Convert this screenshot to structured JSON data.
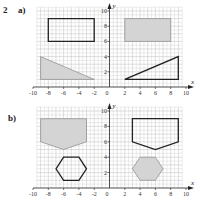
{
  "question_number": "2",
  "colors": {
    "grid": "#c8c8c8",
    "axis": "#222222",
    "shade": "#d4d4d4",
    "outline": "#222222"
  },
  "chart_data": [
    {
      "type": "diagram",
      "part": "a)",
      "xlabel": "x",
      "ylabel": "y",
      "xlim": [
        -10,
        10
      ],
      "ylim": [
        0,
        10
      ],
      "grid": true,
      "x_ticks": [
        "-10",
        "-8",
        "-6",
        "-4",
        "-2",
        "2",
        "4",
        "6",
        "8",
        "10"
      ],
      "x_tick_values": [
        -10,
        -8,
        -6,
        -4,
        -2,
        2,
        4,
        6,
        8,
        10
      ],
      "y_ticks": [
        "2",
        "4",
        "6",
        "8",
        "10"
      ],
      "y_tick_values": [
        2,
        4,
        6,
        8,
        10
      ],
      "origin_label": "0",
      "shapes": [
        {
          "name": "rectangle-left",
          "filled": false,
          "points": [
            [
              -8,
              6
            ],
            [
              -2,
              6
            ],
            [
              -2,
              9
            ],
            [
              -8,
              9
            ]
          ]
        },
        {
          "name": "rectangle-right",
          "filled": true,
          "points": [
            [
              2,
              6
            ],
            [
              8,
              6
            ],
            [
              8,
              9
            ],
            [
              2,
              9
            ]
          ]
        },
        {
          "name": "triangle-left",
          "filled": true,
          "points": [
            [
              -9,
              1
            ],
            [
              -9,
              4
            ],
            [
              -2,
              1
            ]
          ]
        },
        {
          "name": "triangle-right",
          "filled": false,
          "points": [
            [
              2,
              1
            ],
            [
              9,
              1
            ],
            [
              9,
              4
            ]
          ]
        }
      ]
    },
    {
      "type": "diagram",
      "part": "b)",
      "xlabel": "x",
      "ylabel": "y",
      "xlim": [
        -10,
        10
      ],
      "ylim": [
        0,
        10
      ],
      "grid": true,
      "x_ticks": [
        "-10",
        "-8",
        "-6",
        "-4",
        "-2",
        "2",
        "4",
        "6",
        "8",
        "10"
      ],
      "x_tick_values": [
        -10,
        -8,
        -6,
        -4,
        -2,
        2,
        4,
        6,
        8,
        10
      ],
      "y_ticks": [
        "2",
        "4",
        "6",
        "8",
        "10"
      ],
      "y_tick_values": [
        2,
        4,
        6,
        8,
        10
      ],
      "origin_label": "0",
      "shapes": [
        {
          "name": "pentagon-left",
          "filled": true,
          "points": [
            [
              -9,
              9
            ],
            [
              -3,
              9
            ],
            [
              -3,
              6
            ],
            [
              -6,
              5
            ],
            [
              -9,
              6
            ]
          ]
        },
        {
          "name": "pentagon-right",
          "filled": false,
          "points": [
            [
              3,
              9
            ],
            [
              9,
              9
            ],
            [
              9,
              6
            ],
            [
              6,
              5
            ],
            [
              3,
              6
            ]
          ]
        },
        {
          "name": "hexagon-left",
          "filled": false,
          "points": [
            [
              -7,
              2.5
            ],
            [
              -6,
              4
            ],
            [
              -4,
              4
            ],
            [
              -3,
              2.5
            ],
            [
              -4,
              1
            ],
            [
              -6,
              1
            ]
          ]
        },
        {
          "name": "hexagon-right",
          "filled": true,
          "points": [
            [
              3,
              2.5
            ],
            [
              4,
              4
            ],
            [
              6,
              4
            ],
            [
              7,
              2.5
            ],
            [
              6,
              1
            ],
            [
              4,
              1
            ]
          ]
        }
      ]
    }
  ]
}
